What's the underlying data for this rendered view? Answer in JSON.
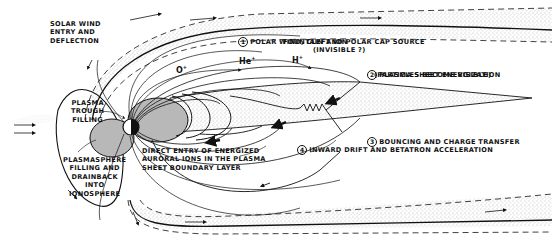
{
  "diagram": {
    "labels": {
      "solar_wind": "SOLAR WIND\nENTRY AND\nDEFLECTION",
      "polar_wind_num": "1",
      "polar_wind_line1": "POLAR WIND, CLEFT ION",
      "polar_wind_line2": "FOUNTAIN AND POLAR CAP SOURCE",
      "polar_wind_line3": "(INVISIBLE ?)",
      "plasma_sheet_num": "2",
      "plasma_sheet_line1": "PLASMA SHEET ENERGIZATION",
      "plasma_sheet_line2": "(PARTICLES BECOME VISIBLE)",
      "bouncing_num": "3",
      "bouncing": "BOUNCING AND CHARGE TRANSFER",
      "inward_num": "4",
      "inward": "INWARD DRIFT AND BETATRON ACCELERATION",
      "trough": "PLASMA\nTROUGH\nFILLING",
      "plasmasphere": "PLASMASPHERE\nFILLING AND\nDRAINBACK\nINTO\nIONOSPHERE",
      "direct_entry": "DIRECT ENTRY OF ENERGIZED\nAURORAL IONS IN THE PLASMA\nSHEET BOUNDARY LAYER"
    },
    "ions": [
      {
        "base": "O",
        "charge": "+"
      },
      {
        "base": "He",
        "charge": "+"
      },
      {
        "base": "H",
        "charge": "+"
      }
    ],
    "colors": {
      "ink": "#111111",
      "stipple": "#9a9a9a",
      "plasmasphere_fill": "#b8b8b8",
      "background": "#ffffff"
    }
  }
}
